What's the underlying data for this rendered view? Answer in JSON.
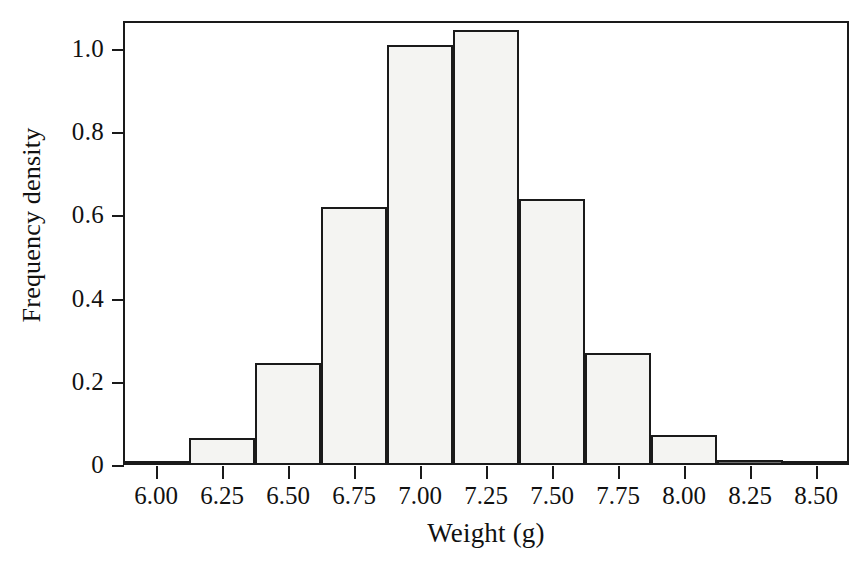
{
  "chart_data": {
    "type": "bar",
    "chart_subtype": "histogram",
    "title": "",
    "xlabel": "Weight (g)",
    "ylabel": "Frequency density",
    "xlim": [
      5.875,
      8.625
    ],
    "ylim": [
      0,
      1.0667
    ],
    "grid": false,
    "legend": null,
    "bin_width": 0.25,
    "bin_edges": [
      5.875,
      6.125,
      6.375,
      6.625,
      6.875,
      7.125,
      7.375,
      7.625,
      7.875,
      8.125,
      8.375,
      8.625
    ],
    "bin_centers": [
      6.0,
      6.25,
      6.5,
      6.75,
      7.0,
      7.25,
      7.5,
      7.75,
      8.0,
      8.25,
      8.5
    ],
    "values": [
      0.008,
      0.065,
      0.245,
      0.62,
      1.01,
      1.045,
      0.64,
      0.27,
      0.072,
      0.012,
      0.006
    ],
    "xticks": [
      6.0,
      6.25,
      6.5,
      6.75,
      7.0,
      7.25,
      7.5,
      7.75,
      8.0,
      8.25,
      8.5
    ],
    "xtick_labels": [
      "6.00",
      "6.25",
      "6.50",
      "6.75",
      "7.00",
      "7.25",
      "7.50",
      "7.75",
      "8.00",
      "8.25",
      "8.50"
    ],
    "yticks": [
      0,
      0.2,
      0.4,
      0.6,
      0.8,
      1.0
    ],
    "ytick_labels": [
      "0",
      "0.2",
      "0.4",
      "0.6",
      "0.8",
      "1.0"
    ],
    "bar_fill_color": "#f4f4f2",
    "bar_edge_color": "#1a1a1a",
    "axis_color": "#1a1a1a",
    "background_color": "#ffffff"
  },
  "axes": {
    "xlabel": "Weight (g)",
    "ylabel": "Frequency density"
  }
}
